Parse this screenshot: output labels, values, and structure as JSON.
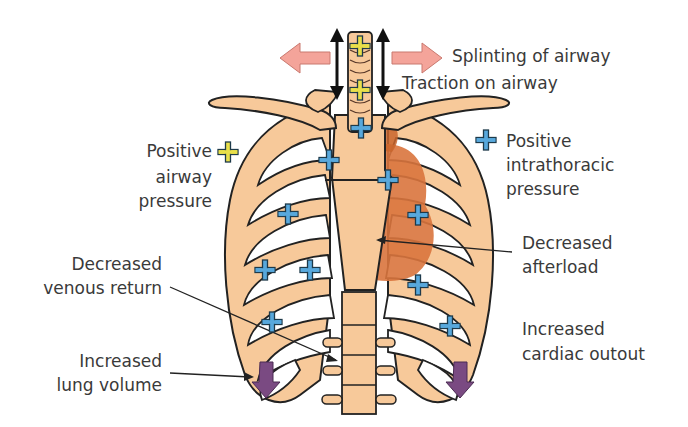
{
  "colors": {
    "bone": "#f7c99a",
    "outline": "#222222",
    "heart": "#d9743d",
    "heart_shade": "#b7a27a",
    "airway_plus": "#e8df4a",
    "thoracic_plus": "#58a8dc",
    "lung_arrow": "#7a4a82",
    "splint_arrow": "#f4a49a",
    "text": "#3a3a3a"
  },
  "labels": {
    "splinting": "Splinting of airway",
    "traction": "Traction on airway",
    "positive_airway": [
      "Positive",
      "airway",
      "pressure"
    ],
    "positive_intrathoracic": [
      "Positive",
      "intrathoracic",
      "pressure"
    ],
    "decreased_afterload": [
      "Decreased",
      "afterload"
    ],
    "decreased_venous_return": [
      "Decreased",
      "venous return"
    ],
    "increased_lung_volume": [
      "Increased",
      "lung volume"
    ],
    "increased_cardiac_output": [
      "Increased",
      "cardiac outout"
    ]
  },
  "legend": {
    "yellow_plus": "positive-airway-pressure-marker",
    "blue_plus": "positive-intrathoracic-pressure-marker"
  }
}
